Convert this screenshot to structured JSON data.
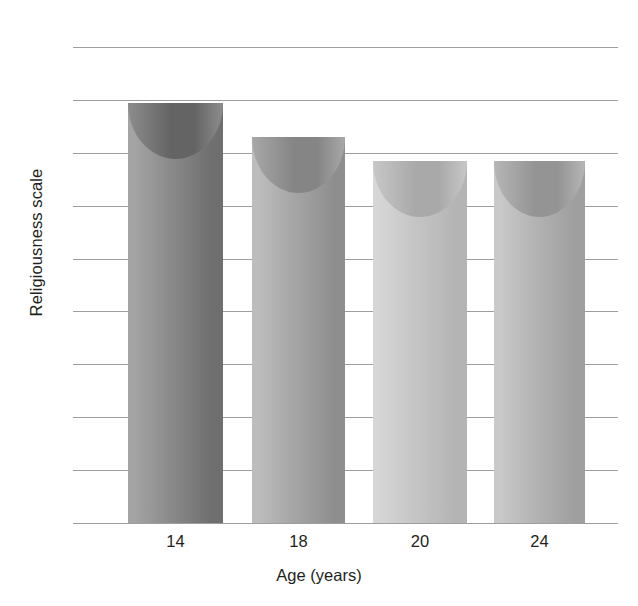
{
  "chart_data": {
    "type": "bar",
    "title": "",
    "subtitle": "",
    "xlabel": "Age (years)",
    "ylabel": "Religiousness scale",
    "categories": [
      "14",
      "18",
      "20",
      "24"
    ],
    "values": [
      15.9,
      14.6,
      13.7,
      13.7
    ],
    "series": [
      {
        "name": "Religiousness scale",
        "values": [
          15.9,
          14.6,
          13.7,
          13.7
        ]
      }
    ],
    "ylim": [
      0,
      18
    ],
    "ytick_values": [
      18,
      16,
      14,
      12,
      10,
      8,
      6,
      4,
      2,
      0
    ],
    "ytick_labels": [
      "18",
      "16",
      "14",
      "12",
      "10",
      "8",
      "6",
      "4",
      "2",
      "0"
    ],
    "ystep": 2,
    "xtick_labels": [
      "14",
      "18",
      "20",
      "24"
    ],
    "grid": true,
    "grid_axis": "y",
    "legend": false,
    "legend_position": "none",
    "bar_style": "cylinder",
    "annotations": []
  },
  "style": {
    "background": "#ffffff",
    "text_color": "#231f20",
    "gridline_color": "#9e9e9e",
    "bar_colors": [
      {
        "light": "#a4a4a4",
        "mid": "#8d8d8d",
        "dark": "#6f6f6f",
        "cap": "#646464"
      },
      {
        "light": "#bdbdbd",
        "mid": "#a8a8a8",
        "dark": "#8e8e8e",
        "cap": "#858585"
      },
      {
        "light": "#d6d6d6",
        "mid": "#c7c7c7",
        "dark": "#b4b4b4",
        "cap": "#a9a9a9"
      },
      {
        "light": "#c9c9c9",
        "mid": "#b6b6b6",
        "dark": "#9f9f9f",
        "cap": "#949494"
      }
    ]
  },
  "geometry": {
    "plot_left": 73,
    "plot_top": 47,
    "plot_width": 545,
    "plot_height": 476,
    "bars": [
      {
        "left": 55,
        "width": 95
      },
      {
        "left": 179,
        "width": 93
      },
      {
        "left": 300,
        "width": 94
      },
      {
        "left": 421,
        "width": 91
      }
    ]
  }
}
